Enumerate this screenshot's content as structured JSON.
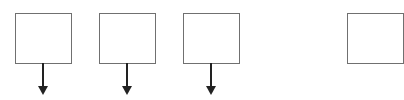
{
  "diagram": {
    "nodes": [
      {
        "id": "box-1",
        "label": "",
        "x": 15
      },
      {
        "id": "box-2",
        "label": "",
        "x": 99
      },
      {
        "id": "box-3",
        "label": "",
        "x": 183
      },
      {
        "id": "box-4",
        "label": "",
        "x": 347,
        "partially_visible": true
      }
    ],
    "arrows": [
      {
        "from": "box-1",
        "direction": "down"
      },
      {
        "from": "box-2",
        "direction": "down"
      },
      {
        "from": "box-3",
        "direction": "down"
      }
    ],
    "colors": {
      "box_border": "#707070",
      "arrow": "#222222",
      "background": "#ffffff"
    }
  }
}
